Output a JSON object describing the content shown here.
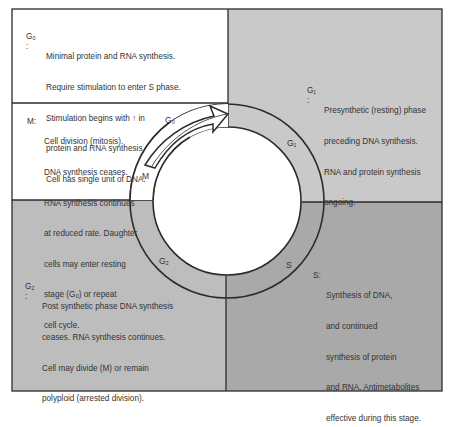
{
  "colors": {
    "background": "#ffffff",
    "g1_quadrant": "#c9c9c9",
    "s_quadrant": "#a9a9a9",
    "g2_quadrant": "#bdbdbd",
    "line": "#2b2b2b"
  },
  "phases": {
    "g0": {
      "tag": "G₀ :",
      "ring_label": "G₀",
      "lines": [
        "Minimal protein and RNA synthesis.",
        "Require stimulation to enter S phase.",
        "Stimulation begins with ↑ in",
        "protein and RNA synthesis.",
        "Cell has single unit of DNA."
      ]
    },
    "g1": {
      "tag": "G₁ :",
      "ring_label": "G₁",
      "lines": [
        "Presynthetic (resting) phase",
        "preceding DNA synthesis.",
        "RNA and protein synthesis",
        "ongoing."
      ]
    },
    "m": {
      "tag": "M:",
      "ring_label": "M",
      "lines": [
        "Cell division (mitosis).",
        "DNA synthesis ceases.",
        "RNA synthesis continues",
        "at reduced rate. Daughter",
        "cells may enter resting",
        "stage (G₀) or repeat",
        "cell cycle."
      ]
    },
    "g2": {
      "tag": "G₂ :",
      "ring_label": "G₂",
      "lines": [
        "Post synthetic phase DNA synthesis",
        "ceases. RNA synthesis continues.",
        "Cell may divide (M) or remain",
        "polyploid (arrested division)."
      ]
    },
    "s": {
      "tag": "S:",
      "ring_label": "S",
      "lines": [
        "Synthesis of DNA,",
        "and continued",
        "synthesis of protein",
        "and RNA. Antimetabolites",
        "effective during this stage."
      ]
    }
  }
}
